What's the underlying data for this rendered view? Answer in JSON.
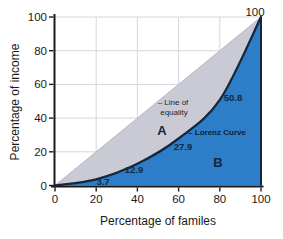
{
  "chart_data": {
    "type": "area",
    "xlabel": "Percentage of familes",
    "ylabel": "Percentage of income",
    "xlim": [
      0,
      100
    ],
    "ylim": [
      0,
      100
    ],
    "x_ticks": [
      0,
      20,
      40,
      60,
      80,
      100
    ],
    "y_ticks": [
      0,
      20,
      40,
      60,
      80,
      100
    ],
    "grid": true,
    "legend": "none",
    "series": [
      {
        "name": "Line of equality",
        "x": [
          0,
          100
        ],
        "y": [
          0,
          100
        ],
        "area_label": "A"
      },
      {
        "name": "Lorenz Curve",
        "x": [
          0,
          20,
          40,
          60,
          80,
          100
        ],
        "y": [
          0,
          3.7,
          12.9,
          27.9,
          50.8,
          100
        ],
        "area_label": "B"
      }
    ],
    "annotations": [
      {
        "id": "point-label-3-7",
        "text": "3.7",
        "px": 103,
        "py": 181,
        "cls": "value"
      },
      {
        "id": "point-label-12-9",
        "text": "12.9",
        "px": 134,
        "py": 169,
        "cls": "value"
      },
      {
        "id": "point-label-27-9",
        "text": "27.9",
        "px": 183,
        "py": 146,
        "cls": "value"
      },
      {
        "id": "point-label-50-8",
        "text": "50.8",
        "px": 233,
        "py": 97,
        "cls": "value"
      },
      {
        "id": "corner-label-100",
        "text": "100",
        "px": 255,
        "py": 12,
        "cls": "corner"
      },
      {
        "id": "area-a-label",
        "text": "A",
        "px": 162,
        "py": 130,
        "cls": "area"
      },
      {
        "id": "area-b-label",
        "text": "B",
        "px": 218,
        "py": 162,
        "cls": "area"
      },
      {
        "id": "line-of-equality-label-1",
        "text": "– Line of",
        "px": 173,
        "py": 102,
        "cls": "note"
      },
      {
        "id": "line-of-equality-label-2",
        "text": "equality",
        "px": 174,
        "py": 112,
        "cls": "note"
      },
      {
        "id": "lorenz-curve-label",
        "text": "– Lorenz Curve",
        "px": 217,
        "py": 132,
        "cls": "curve-note"
      }
    ],
    "colors": {
      "equality_area_fill": "#c9cad4",
      "equality_line": "#b4b7c4",
      "lorenz_area_fill": "#2d7dc8",
      "curve_stroke": "#14283c",
      "grid_line": "#d5d7de",
      "axis_line": "#1a1a1a",
      "tick_text": "#1a1a1a",
      "background": "#ffffff"
    }
  }
}
